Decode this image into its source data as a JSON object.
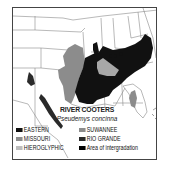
{
  "map": {
    "title": "RIVER COOTERS",
    "subtitle": "Pseudemys concinna",
    "colors": {
      "eastern": "#111111",
      "missouri": "#8c8c8c",
      "hieroglyphic": "#bdbdbd",
      "suwannee": "#8c8c8c",
      "rio_grande": "#2a2a2a",
      "intergradation": "#000000",
      "border": "#444444",
      "state_lines": "#888888"
    }
  },
  "legend": {
    "items": [
      {
        "label": "EASTERN",
        "color": "#111111"
      },
      {
        "label": "MISSOURI",
        "color": "#8c8c8c"
      },
      {
        "label": "HIEROGLYPHIC",
        "color": "#bdbdbd"
      },
      {
        "label": "SUWANNEE",
        "color": "#8c8c8c"
      },
      {
        "label": "RIO GRANDE",
        "color": "#2a2a2a"
      },
      {
        "label": "Area of intergradation",
        "color": "#000000"
      }
    ]
  }
}
